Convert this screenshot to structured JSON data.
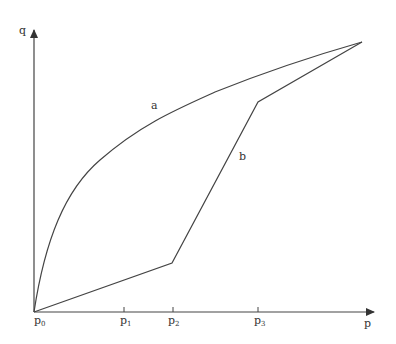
{
  "diagram": {
    "axes": {
      "x_label": "p",
      "y_label": "q",
      "origin_label": {
        "base": "p",
        "sub": "0"
      },
      "ticks": [
        {
          "base": "p",
          "sub": "1",
          "x": 124
        },
        {
          "base": "p",
          "sub": "2",
          "x": 173
        },
        {
          "base": "p",
          "sub": "3",
          "x": 258
        }
      ]
    },
    "curves": {
      "a": {
        "label": "a",
        "description": "concave curve from p0 to the upper-right endpoint"
      },
      "b": {
        "label": "b",
        "description": "piecewise-linear path from p0 via p2 and p3 to the upper-right endpoint"
      }
    },
    "colors": {
      "line": "#444444",
      "text": "#333333",
      "background": "#ffffff"
    }
  }
}
